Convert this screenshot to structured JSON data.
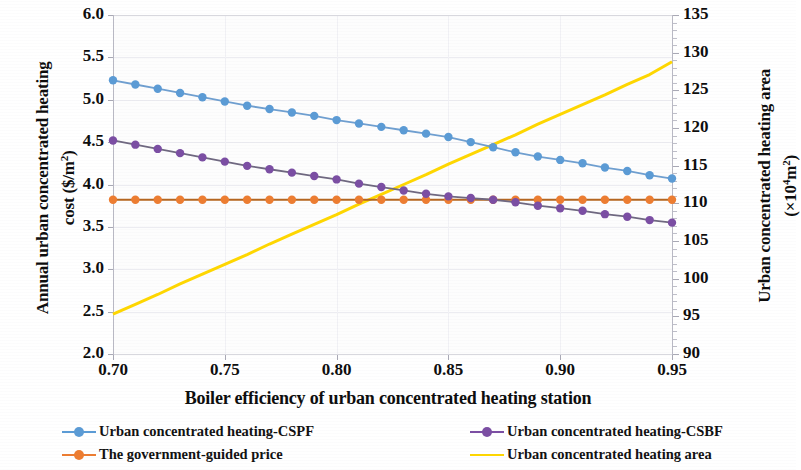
{
  "chart_data": {
    "type": "line",
    "title": "",
    "xlabel": "Boiler efficiency of urban concentrated heating station",
    "ylabel": "Annual urban concentrated heating cost  ($/m²)",
    "y2label": "Urban concentrated heating area  (×10⁴m²)",
    "xlim": [
      0.7,
      0.95
    ],
    "ylim": [
      2.0,
      6.0
    ],
    "y2lim": [
      90,
      135
    ],
    "xticks": [
      "0.70",
      "0.75",
      "0.80",
      "0.85",
      "0.90",
      "0.95"
    ],
    "xtick_values": [
      0.7,
      0.75,
      0.8,
      0.85,
      0.9,
      0.95
    ],
    "yticks": [
      "2.0",
      "2.5",
      "3.0",
      "3.5",
      "4.0",
      "4.5",
      "5.0",
      "5.5",
      "6.0"
    ],
    "ytick_values": [
      2.0,
      2.5,
      3.0,
      3.5,
      4.0,
      4.5,
      5.0,
      5.5,
      6.0
    ],
    "y2ticks": [
      "90",
      "95",
      "100",
      "105",
      "110",
      "115",
      "120",
      "125",
      "130",
      "135"
    ],
    "y2tick_values": [
      90,
      95,
      100,
      105,
      110,
      115,
      120,
      125,
      130,
      135
    ],
    "grid": true,
    "legend_position": "bottom",
    "x": [
      0.7,
      0.71,
      0.72,
      0.73,
      0.74,
      0.75,
      0.76,
      0.77,
      0.78,
      0.79,
      0.8,
      0.81,
      0.82,
      0.83,
      0.84,
      0.85,
      0.86,
      0.87,
      0.88,
      0.89,
      0.9,
      0.91,
      0.92,
      0.93,
      0.94,
      0.95
    ],
    "series": [
      {
        "name": "Urban concentrated heating-CSPF",
        "color": "#5b9bd5",
        "axis": "left",
        "marker": "circle",
        "values": [
          5.23,
          5.18,
          5.13,
          5.08,
          5.03,
          4.98,
          4.93,
          4.89,
          4.85,
          4.81,
          4.76,
          4.72,
          4.68,
          4.64,
          4.6,
          4.56,
          4.5,
          4.44,
          4.38,
          4.33,
          4.29,
          4.25,
          4.2,
          4.16,
          4.11,
          4.07
        ]
      },
      {
        "name": "Urban concentrated heating-CSBF",
        "color": "#7b4ea3",
        "axis": "left",
        "marker": "circle",
        "values": [
          4.52,
          4.47,
          4.42,
          4.37,
          4.32,
          4.27,
          4.22,
          4.18,
          4.14,
          4.1,
          4.06,
          4.01,
          3.97,
          3.93,
          3.89,
          3.86,
          3.84,
          3.82,
          3.79,
          3.75,
          3.72,
          3.69,
          3.65,
          3.62,
          3.58,
          3.55
        ]
      },
      {
        "name": "The government-guided price",
        "color": "#ed7d31",
        "axis": "left",
        "marker": "circle",
        "values": [
          3.82,
          3.82,
          3.82,
          3.82,
          3.82,
          3.82,
          3.82,
          3.82,
          3.82,
          3.82,
          3.82,
          3.82,
          3.82,
          3.82,
          3.82,
          3.82,
          3.82,
          3.82,
          3.82,
          3.82,
          3.82,
          3.82,
          3.82,
          3.82,
          3.82,
          3.82
        ]
      },
      {
        "name": "Urban concentrated heating area",
        "color": "#ffd700",
        "axis": "right",
        "marker": "none",
        "values": [
          95.3,
          96.6,
          97.9,
          99.3,
          100.6,
          101.9,
          103.2,
          104.6,
          105.9,
          107.2,
          108.5,
          109.9,
          111.2,
          112.5,
          113.8,
          115.2,
          116.5,
          117.8,
          119.1,
          120.5,
          121.8,
          123.1,
          124.4,
          125.8,
          127.1,
          128.8
        ]
      }
    ]
  },
  "axes": {
    "y_left_title_line1": "Annual urban concentrated heating",
    "y_left_title_line2_pre": "cost  ($/m",
    "y_left_title_line2_sup": "2",
    "y_left_title_line2_post": ")",
    "y_right_title_line1": "Urban concentrated heating area",
    "y_right_title_line2_pre": "(×10",
    "y_right_title_line2_sup": "4",
    "y_right_title_line2_post": "m",
    "y_right_title_line2_sup2": "2",
    "y_right_title_line2_end": ")",
    "x_title": "Boiler efficiency of urban concentrated heating station"
  },
  "legend": {
    "items": [
      {
        "label": "Urban concentrated heating-CSPF",
        "color": "#5b9bd5",
        "marker": true
      },
      {
        "label": "The government-guided price",
        "color": "#ed7d31",
        "marker": true
      },
      {
        "label": "Urban concentrated heating-CSBF",
        "color": "#7b4ea3",
        "marker": true
      },
      {
        "label": "Urban concentrated heating area",
        "color": "#ffd700",
        "marker": false
      }
    ]
  }
}
